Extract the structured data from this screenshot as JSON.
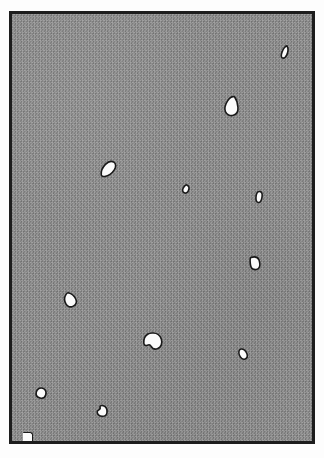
{
  "figure": {
    "description": "Scanned halftone photographic plate: an even mid-grey screened field enclosed by a thin black rule, scattered with small irregular white blobs.",
    "canvas": {
      "width": 324,
      "height": 458
    },
    "page": {
      "background_color": "#fdfdfd"
    }
  },
  "plate": {
    "name": "image-plate",
    "x": 9,
    "y": 11,
    "width": 306,
    "height": 433,
    "frame": {
      "color": "#1d1d1d",
      "thickness_px": 3,
      "style": "solid-rule"
    },
    "field": {
      "label": "halftone grey field",
      "base_color": "#8b8b8b",
      "light_dot_color": "#9a9a9a",
      "dark_dot_color": "#7e7e7e",
      "screen": "checkerboard dither",
      "screen_pitch_px": 3
    }
  },
  "blobs": {
    "fill_color": "#fbfbfb",
    "outline_color": "#1a1a1a",
    "outline_width_px": 1.6,
    "count": 13,
    "items": [
      {
        "id": "blob-01",
        "name": "blob-top-right-sliver",
        "cx": 273,
        "cy": 38,
        "w": 6,
        "h": 13,
        "rotation_deg": 18,
        "shape": "slim-teardrop",
        "size_class": "tiny"
      },
      {
        "id": "blob-02",
        "name": "blob-upper-right-pear",
        "cx": 220,
        "cy": 92,
        "w": 14,
        "h": 19,
        "rotation_deg": 8,
        "shape": "pear",
        "size_class": "large"
      },
      {
        "id": "blob-03",
        "name": "blob-upper-left-spindle",
        "cx": 96,
        "cy": 155,
        "w": 18,
        "h": 11,
        "rotation_deg": -38,
        "shape": "spindle",
        "size_class": "medium"
      },
      {
        "id": "blob-04",
        "name": "blob-centre-speck",
        "cx": 174,
        "cy": 175,
        "w": 6,
        "h": 8,
        "rotation_deg": 25,
        "shape": "speck",
        "size_class": "tiny"
      },
      {
        "id": "blob-05",
        "name": "blob-right-capsule",
        "cx": 247,
        "cy": 183,
        "w": 6,
        "h": 11,
        "rotation_deg": 8,
        "shape": "capsule",
        "size_class": "tiny"
      },
      {
        "id": "blob-06",
        "name": "blob-right-rounded-rect",
        "cx": 243,
        "cy": 249,
        "w": 9,
        "h": 12,
        "rotation_deg": -6,
        "shape": "rounded-rect",
        "size_class": "small"
      },
      {
        "id": "blob-07",
        "name": "blob-left-cone",
        "cx": 58,
        "cy": 286,
        "w": 12,
        "h": 14,
        "rotation_deg": -32,
        "shape": "cone",
        "size_class": "medium"
      },
      {
        "id": "blob-08",
        "name": "blob-centre-large-notched",
        "cx": 141,
        "cy": 327,
        "w": 18,
        "h": 16,
        "rotation_deg": 0,
        "shape": "notched-round",
        "size_class": "largest"
      },
      {
        "id": "blob-09",
        "name": "blob-right-lower-oval",
        "cx": 231,
        "cy": 340,
        "w": 8,
        "h": 11,
        "rotation_deg": -28,
        "shape": "oval",
        "size_class": "small"
      },
      {
        "id": "blob-10",
        "name": "blob-lower-left-round",
        "cx": 29,
        "cy": 379,
        "w": 10,
        "h": 10,
        "rotation_deg": 12,
        "shape": "round",
        "size_class": "small"
      },
      {
        "id": "blob-11",
        "name": "blob-bottom-left-notched",
        "cx": 90,
        "cy": 397,
        "w": 10,
        "h": 10,
        "rotation_deg": 0,
        "shape": "notched-round",
        "size_class": "small"
      }
    ],
    "corner_mark": {
      "id": "blob-12",
      "name": "corner-nick-bottom-left",
      "x": 11,
      "y": 419,
      "w": 9,
      "h": 8,
      "shape": "quarter-wedge",
      "note": "white nick touching the bottom rule at the lower-left corner"
    }
  }
}
